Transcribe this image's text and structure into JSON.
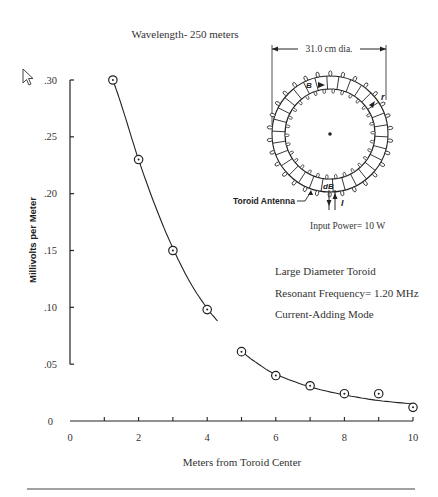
{
  "chart_data": {
    "type": "scatter",
    "title": "Wavelength- 250 meters",
    "xlabel": "Meters from Toroid Center",
    "ylabel": "Millivolts per Meter",
    "xlim": [
      0,
      10
    ],
    "ylim": [
      0,
      0.3
    ],
    "x_ticks": [
      {
        "value": 0,
        "label": "0"
      },
      {
        "value": 2,
        "label": "2"
      },
      {
        "value": 4,
        "label": "4"
      },
      {
        "value": 6,
        "label": "6"
      },
      {
        "value": 8,
        "label": "8"
      },
      {
        "value": 10,
        "label": "10"
      }
    ],
    "x_minor_ticks": [
      1,
      2,
      3,
      4,
      5,
      6,
      7,
      8,
      9,
      10
    ],
    "y_ticks": [
      {
        "value": 0.3,
        "label": ".30"
      },
      {
        "value": 0.25,
        "label": ".25"
      },
      {
        "value": 0.2,
        "label": ".20"
      },
      {
        "value": 0.15,
        "label": ".15"
      },
      {
        "value": 0.1,
        "label": ".10"
      },
      {
        "value": 0.05,
        "label": ".05"
      },
      {
        "value": 0,
        "label": "0"
      }
    ],
    "grid": false,
    "series": [
      {
        "name": "Measured field strength",
        "marker": "circle-dot",
        "x": [
          1.25,
          2,
          3,
          4,
          5,
          6,
          7,
          8,
          9,
          10
        ],
        "y": [
          0.3,
          0.23,
          0.15,
          0.098,
          0.061,
          0.04,
          0.031,
          0.024,
          0.024,
          0.012
        ]
      },
      {
        "name": "Fitted curve",
        "style": "line",
        "x": [
          1.25,
          1.5,
          2,
          2.5,
          3,
          3.5,
          4,
          4.3,
          5,
          5.5,
          6,
          7,
          8,
          9,
          10
        ],
        "y": [
          0.3,
          0.278,
          0.23,
          0.188,
          0.152,
          0.122,
          0.099,
          0.088,
          0.062,
          0.05,
          0.041,
          0.03,
          0.023,
          0.018,
          0.015
        ],
        "gap_between_x": [
          4.3,
          4.9
        ]
      }
    ],
    "annotations": [
      "Large Diameter Toroid",
      "Resonant Frequency= 1.20 MHz",
      "Current-Adding Mode"
    ]
  },
  "inset": {
    "dimension_label": "31.0 cm dia.",
    "antenna_label": "Toroid Antenna",
    "power_label": "Input Power= 10 W",
    "symbol_B_top": "B",
    "symbol_r": "r",
    "symbol_dB": "dB",
    "symbol_I": "I"
  },
  "colors": {
    "ink": "#222222",
    "text": "#333333",
    "background": "#ffffff"
  }
}
